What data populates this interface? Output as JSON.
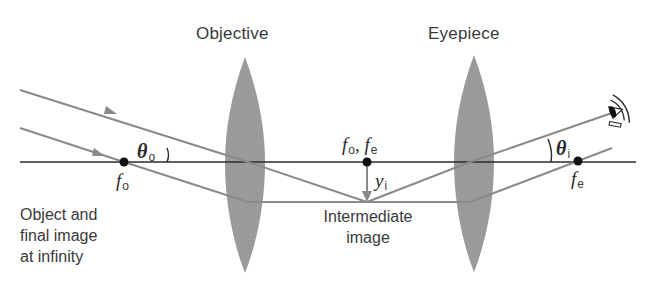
{
  "diagram": {
    "components": {
      "objective": {
        "label": "Objective"
      },
      "eyepiece": {
        "label": "Eyepiece"
      }
    },
    "focal_points": {
      "f_o_left": {
        "symbol": "f",
        "subscript": "o"
      },
      "f_shared": {
        "symbol_1": "f",
        "subscript_1": "o",
        "separator": ",",
        "symbol_2": "f",
        "subscript_2": "e"
      },
      "f_e_right": {
        "symbol": "f",
        "subscript": "e"
      }
    },
    "angles": {
      "theta_o": {
        "symbol": "θ",
        "subscript": "o"
      },
      "theta_i": {
        "symbol": "θ",
        "subscript": "i"
      }
    },
    "image_height": {
      "symbol": "y",
      "subscript": "i"
    },
    "annotations": {
      "object_note": [
        "Object and",
        "final image",
        "at infinity"
      ],
      "intermediate_note": [
        "Intermediate",
        "image"
      ]
    },
    "icons": {
      "eye": "eye-icon",
      "arrow": "ray-direction-arrow-icon"
    },
    "colors": {
      "ray": "#8a8a8a",
      "axis": "#2b2b2b",
      "lens": "#9a9a9a",
      "dot": "#111111",
      "text": "#3a3a3a"
    }
  }
}
